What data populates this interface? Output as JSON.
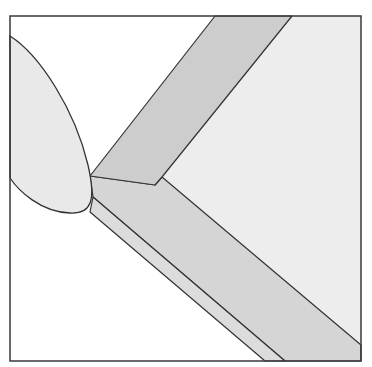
{
  "diagram": {
    "type": "geometric-illustration",
    "canvas": {
      "width": 372,
      "height": 367
    },
    "frame": {
      "x1": 10,
      "y1": 16,
      "x2": 361,
      "y2": 361,
      "stroke": "#3a3a3a"
    },
    "colors": {
      "background": "#ffffff",
      "ellipse_fill": "#e9e9e9",
      "upper_band_fill": "#cdcdcd",
      "lower_band_fill": "#d5d5d5",
      "thin_strip_fill": "#dcdcdc",
      "right_region_fill": "#ededed",
      "stroke": "#333333"
    },
    "shapes": {
      "right_region": "292,16 361,16 361,345 162,177",
      "upper_band": "215,16 292,16 162,177 155,185 90,176",
      "lower_band": "90,176 155,185 162,177 361,345 361,361 285,361 93,197",
      "thin_strip": "93,197 285,361 265,361 90,212",
      "ellipse_path": "M10,36 C40,55 75,110 88,165 C96,200 92,214 70,213 C40,212 18,190 10,178 Z"
    }
  }
}
